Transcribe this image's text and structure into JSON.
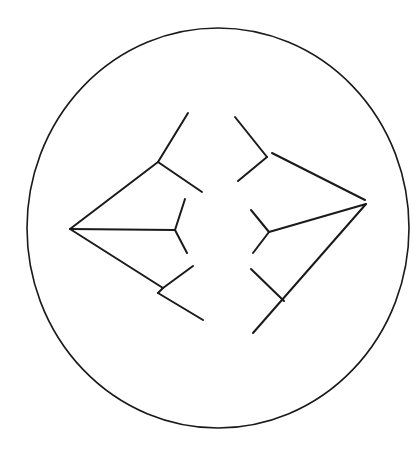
{
  "diagram": {
    "stroke_color": "#1a1a1a",
    "background": "#ffffff",
    "circle": {
      "cx": 218,
      "cy": 228,
      "rx": 191,
      "ry": 200
    },
    "left_tree": {
      "segments": [
        [
          70,
          229,
          158,
          162
        ],
        [
          158,
          162,
          188,
          113
        ],
        [
          158,
          162,
          202,
          192
        ],
        [
          70,
          229,
          175,
          230
        ],
        [
          175,
          230,
          185,
          199
        ],
        [
          175,
          230,
          187,
          253
        ],
        [
          70,
          229,
          163,
          288
        ],
        [
          163,
          288,
          193,
          266
        ],
        [
          163,
          288,
          158,
          293
        ],
        [
          158,
          293,
          203,
          320
        ]
      ]
    },
    "right_tree": {
      "segments": [
        [
          235,
          117,
          267,
          157
        ],
        [
          267,
          157,
          238,
          181
        ],
        [
          272,
          153,
          365,
          200
        ],
        [
          366,
          204,
          269,
          232
        ],
        [
          269,
          232,
          251,
          210
        ],
        [
          269,
          232,
          253,
          253
        ],
        [
          366,
          204,
          253,
          333
        ],
        [
          251,
          269,
          284,
          301
        ]
      ]
    }
  }
}
